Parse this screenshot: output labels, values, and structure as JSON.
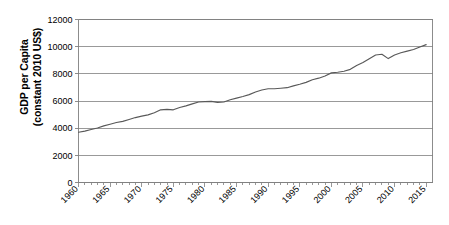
{
  "chart_data": {
    "type": "line",
    "title": "",
    "xlabel": "",
    "ylabel": "GDP per Capita (constant 2010 US$)",
    "ylabel_lines": [
      "GDP per Capita",
      "(constant 2010 US$)"
    ],
    "xlim": [
      1960,
      2016
    ],
    "ylim": [
      0,
      12000
    ],
    "ytick_labels": [
      "0",
      "2000",
      "4000",
      "6000",
      "8000",
      "10000",
      "12000"
    ],
    "ytick_values": [
      0,
      2000,
      4000,
      6000,
      8000,
      10000,
      12000
    ],
    "xtick_labels": [
      "1960",
      "1965",
      "1970",
      "1975",
      "1980",
      "1985",
      "1990",
      "1995",
      "2000",
      "2005",
      "2010",
      "2015"
    ],
    "xtick_values": [
      1960,
      1965,
      1970,
      1975,
      1980,
      1985,
      1990,
      1995,
      2000,
      2005,
      2010,
      2015
    ],
    "grid": "horizontal",
    "legend": "none",
    "line_color": "#595959",
    "axis_color": "#808080",
    "grid_color": "#808080",
    "series": [
      {
        "name": "GDP per Capita",
        "x": [
          1960,
          1961,
          1962,
          1963,
          1964,
          1965,
          1966,
          1967,
          1968,
          1969,
          1970,
          1971,
          1972,
          1973,
          1974,
          1975,
          1976,
          1977,
          1978,
          1979,
          1980,
          1981,
          1982,
          1983,
          1984,
          1985,
          1986,
          1987,
          1988,
          1989,
          1990,
          1991,
          1992,
          1993,
          1994,
          1995,
          1996,
          1997,
          1998,
          1999,
          2000,
          2001,
          2002,
          2003,
          2004,
          2005,
          2006,
          2007,
          2008,
          2009,
          2010,
          2011,
          2012,
          2013,
          2014,
          2015
        ],
        "values": [
          3700,
          3780,
          3900,
          4010,
          4170,
          4290,
          4420,
          4500,
          4640,
          4780,
          4890,
          4980,
          5130,
          5350,
          5380,
          5350,
          5520,
          5640,
          5790,
          5930,
          5950,
          5970,
          5900,
          5930,
          6090,
          6210,
          6330,
          6470,
          6660,
          6810,
          6900,
          6900,
          6940,
          6980,
          7110,
          7230,
          7370,
          7560,
          7680,
          7840,
          8070,
          8120,
          8190,
          8330,
          8610,
          8830,
          9110,
          9390,
          9440,
          9120,
          9390,
          9550,
          9670,
          9790,
          9980,
          10150
        ]
      }
    ],
    "annotations": []
  }
}
